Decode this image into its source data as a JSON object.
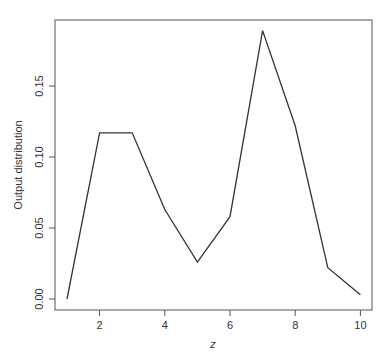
{
  "chart_data": {
    "type": "line",
    "title": "",
    "xlabel": "z",
    "ylabel": "Output distribution",
    "x": [
      1,
      2,
      3,
      4,
      5,
      6,
      7,
      8,
      9,
      10
    ],
    "series": [
      {
        "name": "Output distribution",
        "values": [
          0.0,
          0.117,
          0.117,
          0.063,
          0.026,
          0.058,
          0.189,
          0.122,
          0.022,
          0.003
        ]
      }
    ],
    "xticks": [
      "2",
      "4",
      "6",
      "8",
      "10"
    ],
    "yticks": [
      "0.00",
      "0.05",
      "0.10",
      "0.15"
    ],
    "xlim": [
      0.64,
      10.36
    ],
    "ylim": [
      -0.0077,
      0.197
    ],
    "grid": false,
    "legend": null,
    "line_color": "#333333"
  }
}
